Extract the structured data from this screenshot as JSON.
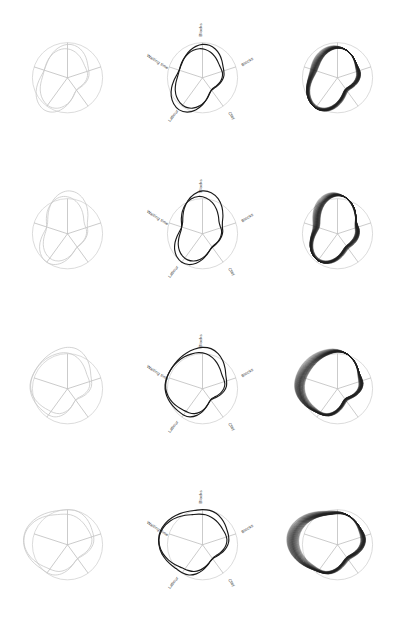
{
  "figure": {
    "rows": 4,
    "columns": 3,
    "background_color": "#ffffff",
    "column_roles": [
      "outline-faint",
      "labeled-radar",
      "layered-moire"
    ]
  },
  "axes": {
    "count": 5,
    "labels": [
      "Blocks",
      "Blocks",
      "Clay",
      "Labour",
      "Waiting time"
    ],
    "angles_deg": [
      90,
      18,
      -54,
      -126,
      162
    ],
    "label_rotations_deg": [
      -90,
      -32,
      52,
      -52,
      32
    ],
    "axis_color": "#b9b9b9",
    "outer_circle_color": "#cfcfcf"
  },
  "colors": {
    "faint_curve": "#c9c9c9",
    "main_curve": "#1a1a1a",
    "stack_curve": "#202020",
    "grid": "#c4c4c4",
    "label_text": "#333333"
  },
  "chart_data": {
    "type": "line",
    "xlabel": "",
    "ylabel": "",
    "categories": [
      "Blocks",
      "Blocks",
      "Clay",
      "Labour",
      "Waiting time"
    ],
    "rlim": [
      0,
      1.35
    ],
    "grid": true,
    "legend_position": "none",
    "series": [
      {
        "name": "Row 1 — stage 1",
        "values": [
          0.95,
          0.62,
          0.46,
          1.08,
          0.72
        ]
      },
      {
        "name": "Row 2 — stage 2",
        "values": [
          1.22,
          0.58,
          0.5,
          0.96,
          0.64
        ]
      },
      {
        "name": "Row 3 — stage 3",
        "values": [
          1.18,
          0.7,
          0.42,
          0.88,
          1.1
        ]
      },
      {
        "name": "Row 4 — stage 4",
        "values": [
          1.0,
          0.76,
          0.52,
          0.94,
          1.3
        ]
      }
    ],
    "annotations": [
      "Column 1 renders the base outline in light grey",
      "Column 2 overlays the dark parametric curve with labeled 5-axis radar",
      "Column 3 stacks 40 phase-shifted copies producing a moire shading"
    ]
  },
  "panels": [
    {
      "row": 1,
      "cells": [
        {
          "column": 1,
          "style": "outline-faint",
          "labels_visible": false
        },
        {
          "column": 2,
          "style": "labeled-radar",
          "labels_visible": true
        },
        {
          "column": 3,
          "style": "layered-moire",
          "labels_visible": false,
          "layers": 40
        }
      ]
    },
    {
      "row": 2,
      "cells": [
        {
          "column": 1,
          "style": "outline-faint",
          "labels_visible": false
        },
        {
          "column": 2,
          "style": "labeled-radar",
          "labels_visible": true
        },
        {
          "column": 3,
          "style": "layered-moire",
          "labels_visible": false,
          "layers": 40
        }
      ]
    },
    {
      "row": 3,
      "cells": [
        {
          "column": 1,
          "style": "outline-faint",
          "labels_visible": false
        },
        {
          "column": 2,
          "style": "labeled-radar",
          "labels_visible": true
        },
        {
          "column": 3,
          "style": "layered-moire",
          "labels_visible": false,
          "layers": 40
        }
      ]
    },
    {
      "row": 4,
      "cells": [
        {
          "column": 1,
          "style": "outline-faint",
          "labels_visible": false
        },
        {
          "column": 2,
          "style": "labeled-radar",
          "labels_visible": true
        },
        {
          "column": 3,
          "style": "layered-moire",
          "labels_visible": false,
          "layers": 40
        }
      ]
    }
  ]
}
